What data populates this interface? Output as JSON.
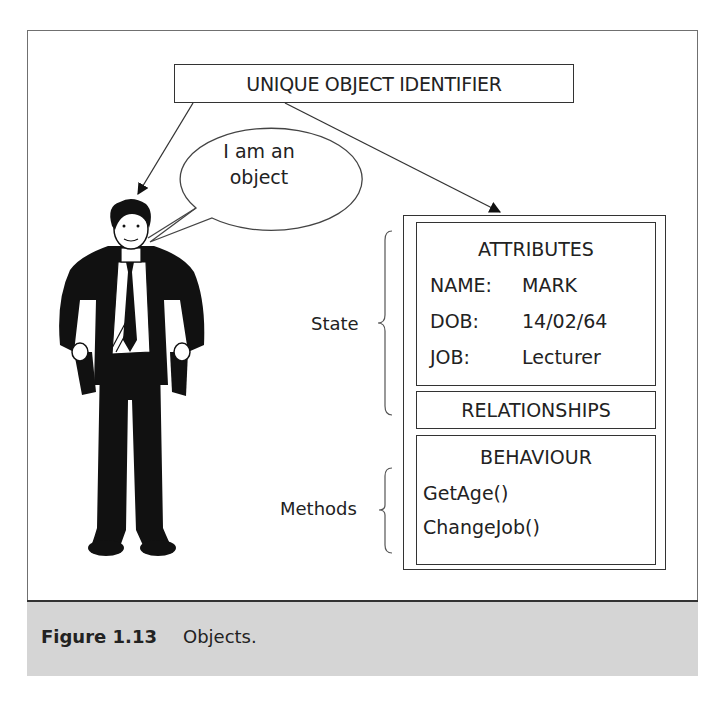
{
  "figure": {
    "identifier_label": "UNIQUE OBJECT IDENTIFIER",
    "speech_bubble": [
      "I am an",
      "object"
    ],
    "attributes": {
      "heading": "ATTRIBUTES",
      "rows": [
        {
          "key": "NAME:",
          "value": "MARK"
        },
        {
          "key": "DOB:",
          "value": "14/02/64"
        },
        {
          "key": "JOB:",
          "value": "Lecturer"
        }
      ]
    },
    "relationships": {
      "heading": "RELATIONSHIPS"
    },
    "behaviour": {
      "heading": "BEHAVIOUR",
      "methods": [
        "GetAge()",
        "ChangeJob()"
      ]
    },
    "brace_labels": {
      "state": "State",
      "methods": "Methods"
    },
    "person_icon": "businessman-illustration"
  },
  "caption": {
    "number": "Figure 1.13",
    "text": "Objects."
  },
  "colors": {
    "line": "#333333",
    "caption_bg": "#d5d5d5",
    "frame": "#707070"
  }
}
